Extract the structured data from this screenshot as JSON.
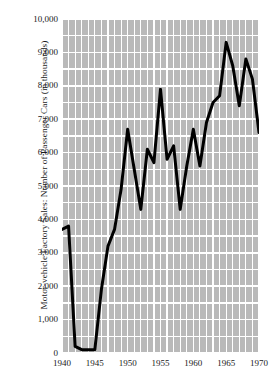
{
  "chart_data": {
    "type": "line",
    "title": "",
    "xlabel": "",
    "ylabel": "Motor-vehicle Factory Sales: Number of Passenger Cars (in thousands)",
    "xlim": [
      1940,
      1970
    ],
    "ylim": [
      0,
      10000
    ],
    "grid": true,
    "legend": null,
    "x_ticks": [
      1940,
      1945,
      1950,
      1955,
      1960,
      1965,
      1970
    ],
    "x_tick_labels": [
      "1940",
      "1945",
      "1950",
      "1955",
      "1960",
      "1965",
      "1970"
    ],
    "y_ticks": [
      0,
      1000,
      2000,
      3000,
      4000,
      5000,
      6000,
      7000,
      8000,
      9000,
      10000
    ],
    "y_tick_labels": [
      "0",
      "1,000",
      "2,000",
      "3,000",
      "4,000",
      "5,000",
      "6,000",
      "7,000",
      "8,000",
      "9,000",
      "10,000"
    ],
    "y_minor_step": 500,
    "x_minor_step": 1,
    "series": [
      {
        "name": "Passenger car factory sales",
        "color": "#000000",
        "line_width": 3,
        "x": [
          1940,
          1941,
          1942,
          1943,
          1944,
          1945,
          1946,
          1947,
          1948,
          1949,
          1950,
          1951,
          1952,
          1953,
          1954,
          1955,
          1956,
          1957,
          1958,
          1959,
          1960,
          1961,
          1962,
          1963,
          1964,
          1965,
          1966,
          1967,
          1968,
          1969,
          1970
        ],
        "values": [
          3700,
          3800,
          200,
          100,
          100,
          100,
          1900,
          3200,
          3700,
          4900,
          6700,
          5500,
          4300,
          6100,
          5700,
          7900,
          5800,
          6200,
          4300,
          5600,
          6700,
          5600,
          6900,
          7500,
          7700,
          9300,
          8600,
          7400,
          8800,
          8200,
          6600
        ]
      }
    ]
  },
  "axes": {
    "y_title": "Motor-vehicle Factory Sales: Number of Passenger Cars (in thousands)"
  },
  "plot_geometry": {
    "left_px": 62,
    "top_px": 19,
    "width_px": 197,
    "height_px": 334
  },
  "colors": {
    "grid_block": "#b9b9b9",
    "grid_line": "#ffffff",
    "data_line": "#000000",
    "text": "#1a1a1a",
    "background": "#ffffff"
  }
}
